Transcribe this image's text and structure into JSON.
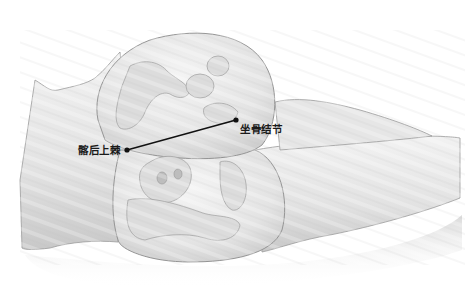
{
  "figure": {
    "colors": {
      "background": "#ffffff",
      "skin_fill": "#e9e9e9",
      "skin_shade": "#c9c9c9",
      "outline": "#8a8a8a",
      "bone_fill": "#dcdcdc",
      "marker": "#111111",
      "label_text": "#1a1a1a"
    }
  },
  "annotations": {
    "psis": {
      "label": "髂后上棘",
      "point": [
        127,
        150
      ]
    },
    "ischial_tuberosity": {
      "label": "坐骨结节",
      "point": [
        236,
        120
      ]
    },
    "connector_line": {
      "from": [
        127,
        150
      ],
      "to": [
        236,
        120
      ]
    }
  }
}
